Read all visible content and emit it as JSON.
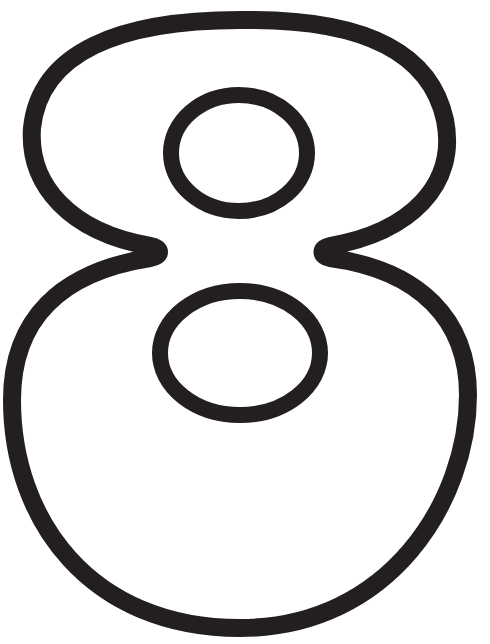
{
  "figure": {
    "glyph": "8",
    "stroke_color": "#231f20",
    "fill_color": "#ffffff",
    "background_color": "#ffffff",
    "stroke_width": 18
  }
}
